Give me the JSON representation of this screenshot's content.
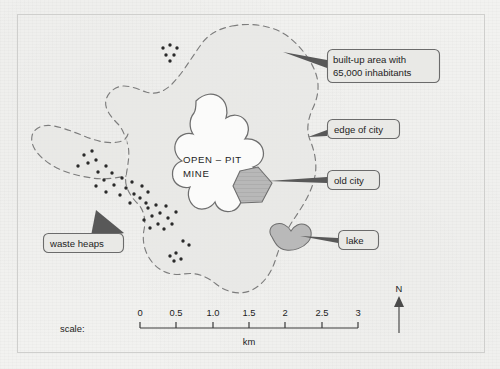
{
  "map": {
    "title_region": "OPEN – PIT MINE",
    "mine_label_line1": "OPEN – PIT",
    "mine_label_line2": "MINE",
    "background_color": "#f2f2f0",
    "ink_color": "#1d1d1d",
    "callout_fill": "#e9e9e6",
    "callout_stroke": "#6b6b6b",
    "feature_grey": "#b4b4b4",
    "city_area_grey": "#e6e6e4",
    "callouts": [
      {
        "id": "built-up-area",
        "line1": "built-up area with",
        "line2": "65,000 inhabitants"
      },
      {
        "id": "edge-of-city",
        "line1": "edge of city"
      },
      {
        "id": "old-city",
        "line1": "old city"
      },
      {
        "id": "lake",
        "line1": "lake"
      },
      {
        "id": "waste-heaps",
        "line1": "waste heaps"
      }
    ],
    "scale": {
      "label": "scale:",
      "unit": "km",
      "ticks": [
        "0",
        "0.5",
        "1.0",
        "1.5",
        "2",
        "2.5",
        "3"
      ],
      "min": 0,
      "max": 3
    },
    "compass": {
      "north_label": "N"
    }
  }
}
